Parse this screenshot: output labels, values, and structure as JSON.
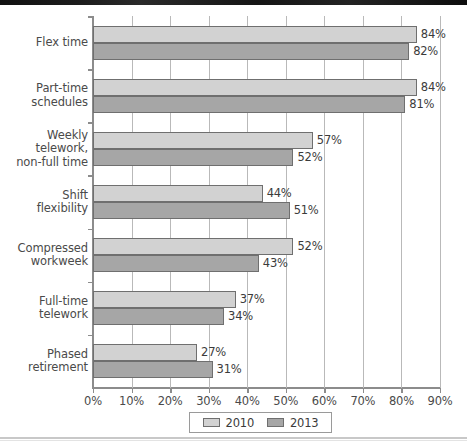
{
  "chart_data": {
    "type": "bar",
    "orientation": "horizontal",
    "title": "",
    "xlabel": "",
    "ylabel": "",
    "xlim": [
      0,
      90
    ],
    "xticks": [
      0,
      10,
      20,
      30,
      40,
      50,
      60,
      70,
      80,
      90
    ],
    "xtick_labels": [
      "0%",
      "10%",
      "20%",
      "30%",
      "40%",
      "50%",
      "60%",
      "70%",
      "80%",
      "90%"
    ],
    "grid": true,
    "grid_axis": "x",
    "legend_position": "bottom",
    "categories": [
      "Flex time",
      "Part-time schedules",
      "Weekly telework, non-full time",
      "Shift flexibility",
      "Compressed workweek",
      "Full-time telework",
      "Phased retirement"
    ],
    "category_lines": [
      [
        "Flex time"
      ],
      [
        "Part-time",
        "schedules"
      ],
      [
        "Weekly",
        "telework,",
        "non-full time"
      ],
      [
        "Shift",
        "flexibility"
      ],
      [
        "Compressed",
        "workweek"
      ],
      [
        "Full-time",
        "telework"
      ],
      [
        "Phased",
        "retirement"
      ]
    ],
    "series": [
      {
        "name": "2010",
        "color": "#d2d2d2",
        "values": [
          84,
          84,
          57,
          44,
          52,
          37,
          27
        ],
        "labels": [
          "84%",
          "84%",
          "57%",
          "44%",
          "52%",
          "37%",
          "27%"
        ]
      },
      {
        "name": "2013",
        "color": "#a6a6a6",
        "values": [
          82,
          81,
          52,
          51,
          43,
          34,
          31
        ],
        "labels": [
          "82%",
          "81%",
          "52%",
          "51%",
          "43%",
          "34%",
          "31%"
        ]
      }
    ]
  },
  "legend": {
    "items": [
      {
        "label": "2010",
        "color": "#d2d2d2"
      },
      {
        "label": "2013",
        "color": "#a6a6a6"
      }
    ]
  },
  "colors": {
    "series_2010": "#d2d2d2",
    "series_2013": "#a6a6a6",
    "bar_border": "#6f6f6f",
    "gridline": "#b9b9b9",
    "axis": "#8c8c8c",
    "text": "#3b3b3b"
  }
}
